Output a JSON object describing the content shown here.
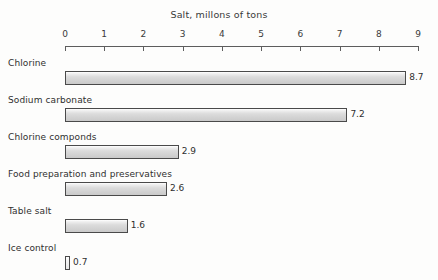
{
  "chart_data": {
    "type": "bar",
    "orientation": "horizontal",
    "title": "Salt, millons of tons",
    "xlabel": "",
    "ylabel": "",
    "xlim": [
      0,
      9
    ],
    "xticks": [
      0,
      1,
      2,
      3,
      4,
      5,
      6,
      7,
      8,
      9
    ],
    "xtick_labels": [
      "0",
      "1",
      "2",
      "3",
      "4",
      "5",
      "6",
      "7",
      "8",
      "9"
    ],
    "grid": false,
    "legend": false,
    "categories": [
      "Chlorine",
      "Sodium carbonate",
      "Chlorine componds",
      "Food preparation and preservatives",
      "Table salt",
      "Ice control"
    ],
    "values": [
      8.7,
      7.2,
      2.9,
      2.6,
      1.6,
      0.7
    ],
    "value_labels": [
      "8.7",
      "7.2",
      "2.9",
      "2.6",
      "1.6",
      "0.7"
    ],
    "bars": [
      {
        "label": "Chlorine",
        "value": 8.7,
        "value_label": "8.7",
        "drawn_units": 8.7
      },
      {
        "label": "Sodium carbonate",
        "value": 7.2,
        "value_label": "7.2",
        "drawn_units": 7.2
      },
      {
        "label": "Chlorine componds",
        "value": 2.9,
        "value_label": "2.9",
        "drawn_units": 2.9
      },
      {
        "label": "Food preparation and preservatives",
        "value": 2.6,
        "value_label": "2.6",
        "drawn_units": 2.6
      },
      {
        "label": "Table salt",
        "value": 1.6,
        "value_label": "1.6",
        "drawn_units": 1.6
      },
      {
        "label": "Ice control",
        "value": 0.7,
        "value_label": "0.7",
        "drawn_units": 0.13
      }
    ],
    "colors": {
      "background": "#fdfdfc",
      "bar_fill": "#d8d8d8",
      "bar_border": "#4a4a4a",
      "axis": "#5d5d5d",
      "text": "#2f2f2f"
    }
  }
}
